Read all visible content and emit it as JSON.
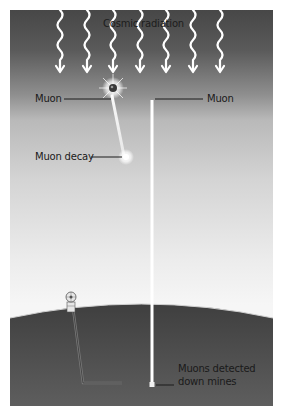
{
  "diagram": {
    "title_label": "Cosmic radiation",
    "labels": {
      "muon_left": "Muon",
      "muon_right": "Muon",
      "muon_decay": "Muon decay",
      "detected_line1": "Muons detected",
      "detected_line2": "down mines"
    },
    "arrow_count": 7,
    "icons": {
      "radiation_arrow": "wavy-arrow-icon",
      "muon_particle": "particle-burst-icon",
      "decay_flash": "decay-flash-icon",
      "mine_headframe": "mine-headframe-icon"
    },
    "colors": {
      "sky_top": "#474747",
      "sky_bottom": "#f6f6f6",
      "earth": "#555555",
      "arrow": "#ffffff",
      "leader_line": "#1a1a1a",
      "mine_shaft": "#6b6b6b"
    }
  }
}
